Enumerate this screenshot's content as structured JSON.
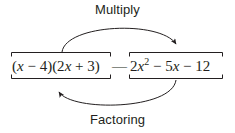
{
  "diagram": {
    "title_top": "Multiply",
    "title_bottom": "Factoring",
    "connector": "—",
    "stroke_color": "#231f20",
    "text_color": "#231f20",
    "background_color": "#ffffff",
    "left_expression": {
      "name": "factored-form",
      "display": "(x − 4)(2x + 3)",
      "parts": {
        "open1": "(",
        "var1": "x",
        "op1": " − 4)(2",
        "var2": "x",
        "op2": " + 3)"
      }
    },
    "right_expression": {
      "name": "expanded-form",
      "display": "2x² − 5x − 12",
      "parts": {
        "coef1": "2",
        "var1": "x",
        "exp1": "2",
        "op1": " − 5",
        "var2": "x",
        "op2": " − 12"
      }
    },
    "arrows": [
      {
        "name": "multiply-arrow",
        "label": "Multiply",
        "direction": "left-to-right",
        "position": "top"
      },
      {
        "name": "factoring-arrow",
        "label": "Factoring",
        "direction": "right-to-left",
        "position": "bottom"
      }
    ]
  }
}
